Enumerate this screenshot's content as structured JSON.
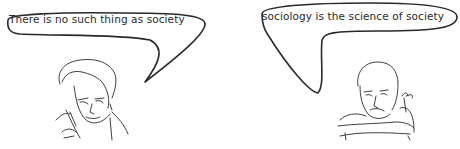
{
  "scene": {
    "background": "#ffffff",
    "ink_color": "#2a2a2a"
  },
  "left_panel": {
    "speaker": "woman-with-phone",
    "speech": "There is no such thing as society"
  },
  "right_panel": {
    "speaker": "man-with-small-plant",
    "speech": "sociology is the science of society"
  }
}
